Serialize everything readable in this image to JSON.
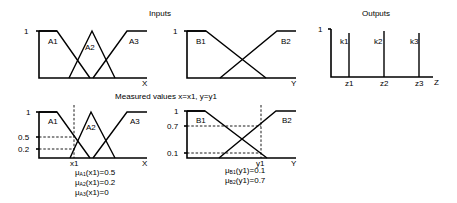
{
  "titles": {
    "inputs": "Inputs",
    "outputs": "Outputs",
    "measured": "Measured values x=x1,  y=y1"
  },
  "top_x_chart": {
    "y_tick": "1",
    "axis_label": "X",
    "sets": [
      "A1",
      "A2",
      "A3"
    ]
  },
  "top_y_chart": {
    "y_tick": "1",
    "axis_label": "Y",
    "sets": [
      "B1",
      "B2"
    ]
  },
  "output_chart": {
    "y_tick": "1",
    "axis_label": "Z",
    "singletons": [
      "k1",
      "k2",
      "k3"
    ],
    "positions": [
      "z1",
      "z2",
      "z3"
    ]
  },
  "bottom_x_chart": {
    "y_ticks": [
      "1",
      "0.5",
      "0.2"
    ],
    "axis_label": "X",
    "marker": "x1",
    "sets": [
      "A1",
      "A2",
      "A3"
    ],
    "memberships": [
      {
        "mu": "μ",
        "sub": "A1",
        "arg": "(x1)=0.5"
      },
      {
        "mu": "μ",
        "sub": "A2",
        "arg": "(x1)=0.2"
      },
      {
        "mu": "μ",
        "sub": "A3",
        "arg": "(x1)=0"
      }
    ]
  },
  "bottom_y_chart": {
    "y_ticks": [
      "1",
      "0.7",
      "0.1"
    ],
    "axis_label": "Y",
    "marker": "y1",
    "sets": [
      "B1",
      "B2"
    ],
    "memberships": [
      {
        "mu": "μ",
        "sub": "B1",
        "arg": "(y1)=0.1"
      },
      {
        "mu": "μ",
        "sub": "B2",
        "arg": "(y1)=0.7"
      }
    ]
  }
}
